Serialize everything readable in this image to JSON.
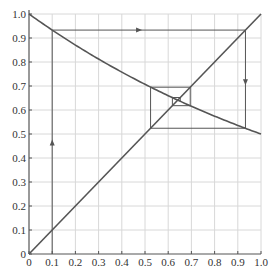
{
  "chart_data": {
    "type": "line",
    "title": "",
    "xlabel": "",
    "ylabel": "",
    "xlim": [
      0,
      1
    ],
    "ylim": [
      0,
      1
    ],
    "grid": true,
    "x_ticks": [
      "0",
      "0.1",
      "0.2",
      "0.3",
      "0.4",
      "0.5",
      "0.6",
      "0.7",
      "0.8",
      "0.9",
      "1.0"
    ],
    "y_ticks": [
      "0",
      "0.1",
      "0.2",
      "0.3",
      "0.4",
      "0.5",
      "0.6",
      "0.7",
      "0.8",
      "0.9",
      "1.0"
    ],
    "series": [
      {
        "name": "y = f(x) (decreasing curve)",
        "x": [
          0,
          0.1,
          0.2,
          0.3,
          0.4,
          0.5,
          0.6,
          0.7,
          0.8,
          0.9,
          1.0
        ],
        "values": [
          1.0,
          0.933,
          0.871,
          0.812,
          0.758,
          0.707,
          0.66,
          0.616,
          0.574,
          0.536,
          0.5
        ]
      },
      {
        "name": "y = x",
        "x": [
          0,
          1
        ],
        "values": [
          0,
          1
        ]
      },
      {
        "name": "cobweb path",
        "points": [
          [
            0.1,
            0
          ],
          [
            0.1,
            0.933
          ],
          [
            0.933,
            0.933
          ],
          [
            0.933,
            0.524
          ],
          [
            0.524,
            0.524
          ],
          [
            0.524,
            0.695
          ],
          [
            0.695,
            0.695
          ],
          [
            0.695,
            0.618
          ],
          [
            0.618,
            0.618
          ],
          [
            0.618,
            0.652
          ],
          [
            0.652,
            0.652
          ],
          [
            0.652,
            0.636
          ]
        ]
      }
    ],
    "annotations": [
      {
        "type": "arrow",
        "direction": "up",
        "at": [
          0.1,
          0.46
        ]
      },
      {
        "type": "arrow",
        "direction": "right",
        "at": [
          0.47,
          0.933
        ]
      },
      {
        "type": "arrow",
        "direction": "down",
        "at": [
          0.933,
          0.72
        ]
      }
    ],
    "colors": {
      "curve": "#555555",
      "grid": "#d8d8d8",
      "axis": "#555555",
      "text": "#333333"
    }
  }
}
